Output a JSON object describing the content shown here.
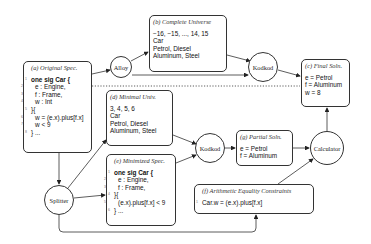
{
  "nodes": {
    "alloy": "Alloy",
    "kodkod_top": "Kodkod",
    "kodkod_mid": "Kodkod",
    "splitter": "Splitter",
    "calculator": "Calculator"
  },
  "boxes": {
    "a": {
      "title": "(a) Original Spec.",
      "lines": [
        "one sig Car {",
        "e : Engine,",
        "f : Frame,",
        "w : Int",
        "}{",
        "w = (e.x).plus[f.x]",
        "w < 9",
        "} ..."
      ],
      "line_numbers": [
        "1",
        "2",
        "3",
        "4",
        "5",
        "6",
        "7",
        "8"
      ]
    },
    "b": {
      "title": "(b) Complete Universe",
      "lines": [
        "−16, −15, ..., 14, 15",
        "Car",
        "Petrol, Diesel",
        "Aluminum, Steel"
      ]
    },
    "c": {
      "title": "(c) Final Soln.",
      "lines": [
        "e = Petrol",
        "f = Aluminum",
        "w = 8"
      ]
    },
    "d": {
      "title": "(d) Minimal Univ.",
      "lines": [
        "3, 4, 5, 6",
        "Car",
        "Petrol, Diesel",
        "Aluminum, Steel"
      ]
    },
    "e": {
      "title": "(e) Minimized Spec.",
      "lines": [
        "one sig Car {",
        "e : Engine,",
        "f : Frame,",
        "}{",
        "(e.x).plus[f.x] < 9",
        "} ..."
      ],
      "line_numbers": [
        "1",
        "2",
        "3",
        "4",
        "5",
        "6"
      ]
    },
    "f": {
      "title": "(f) Arithmetic Equality Constraints",
      "lines": [
        "Car.w = (e.x).plus[f.x]"
      ],
      "line_numbers": [
        "1"
      ]
    },
    "g": {
      "title": "(g) Partial Soln.",
      "lines": [
        "e = Petrol",
        "f = Aluminum"
      ]
    }
  }
}
